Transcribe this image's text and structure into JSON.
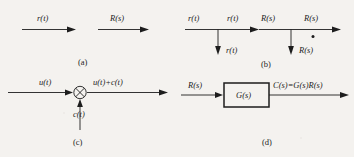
{
  "figure": {
    "background_color": "#f4f2ef",
    "ink_color": "#1d1d1d",
    "width": 354,
    "height": 157
  },
  "panel_a": {
    "caption": "(a)",
    "arrow1_label": "r(t)",
    "arrow2_label": "R(s)"
  },
  "panel_b": {
    "caption": "(b)",
    "left": {
      "input_label": "r(t)",
      "through_label": "r(t)",
      "branch_label": "r(t)"
    },
    "right": {
      "input_label": "R(s)",
      "through_label": "R(s)",
      "branch_label": "R(s)",
      "junction_dot": "branch-point-dot"
    }
  },
  "panel_c": {
    "caption": "(c)",
    "input_label": "u(t)",
    "output_label": "u(t)+c(t)",
    "summing_input_label": "c(t)",
    "summing_junction": "summing-junction-circle-cross"
  },
  "panel_d": {
    "caption": "(d)",
    "input_label": "R(s)",
    "block_label": "G(s)",
    "output_label": "C(s)=G(s)R(s)"
  }
}
